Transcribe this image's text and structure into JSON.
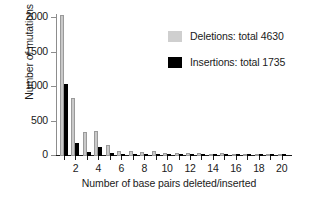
{
  "chart_data": {
    "type": "bar",
    "title": "",
    "xlabel": "Number of base pairs deleted/inserted",
    "ylabel": "Number of mutations",
    "categories": [
      1,
      2,
      3,
      4,
      5,
      6,
      7,
      8,
      9,
      10,
      11,
      12,
      13,
      14,
      15,
      16,
      17,
      18,
      19,
      20
    ],
    "xtick_labels": [
      "2",
      "4",
      "6",
      "8",
      "10",
      "12",
      "14",
      "16",
      "18",
      "20"
    ],
    "xtick_values": [
      2,
      4,
      6,
      8,
      10,
      12,
      14,
      16,
      18,
      20
    ],
    "ytick_labels": [
      "0",
      "500",
      "1000",
      "1500",
      "2000"
    ],
    "ytick_values": [
      0,
      500,
      1000,
      1500,
      2000
    ],
    "xlim": [
      0.3,
      20.9
    ],
    "ylim": [
      0,
      2060
    ],
    "grid": false,
    "legend_position": "upper right",
    "series": [
      {
        "name": "Deletions: total 4630",
        "color": "#c9c9c9",
        "total": 4630,
        "values": [
          2050,
          840,
          350,
          370,
          155,
          75,
          80,
          65,
          70,
          45,
          45,
          45,
          50,
          35,
          40,
          35,
          30,
          30,
          25,
          25
        ]
      },
      {
        "name": "Insertions: total 1735",
        "color": "#000000",
        "total": 1735,
        "values": [
          1050,
          195,
          60,
          130,
          45,
          35,
          30,
          25,
          35,
          20,
          20,
          20,
          20,
          15,
          15,
          15,
          12,
          12,
          10,
          10
        ]
      }
    ]
  },
  "legend": {
    "items": [
      {
        "label": "Deletions: total 4630",
        "swatch": "deletions-swatch"
      },
      {
        "label": "Insertions: total 1735",
        "swatch": "insertions-swatch"
      }
    ]
  }
}
